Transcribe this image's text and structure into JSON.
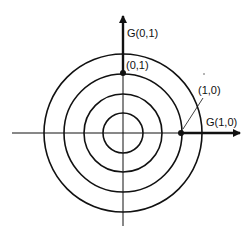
{
  "diagram": {
    "center": [
      123,
      133
    ],
    "circle_radii": [
      20,
      39,
      59,
      79
    ],
    "axes": {
      "horizontal": {
        "x1": 12,
        "x2": 242,
        "y": 133
      },
      "vertical": {
        "y1": 14,
        "y2": 226,
        "x": 123
      }
    },
    "points": [
      {
        "label": "(0,1)",
        "x": 123,
        "y": 73
      },
      {
        "label": "(1,0)",
        "x": 181,
        "y": 133
      }
    ],
    "vectors": [
      {
        "label": "G(0,1)",
        "from": [
          123,
          73
        ],
        "to": [
          123,
          14
        ]
      },
      {
        "label": "G(1,0)",
        "from": [
          181,
          133
        ],
        "to": [
          242,
          133
        ]
      }
    ],
    "labels": {
      "g01": "G(0,1)",
      "p01": "(0,1)",
      "p10": "(1,0)",
      "g10": "G(1,0)"
    },
    "colors": {
      "stroke": "#111111",
      "background": "#ffffff"
    }
  }
}
